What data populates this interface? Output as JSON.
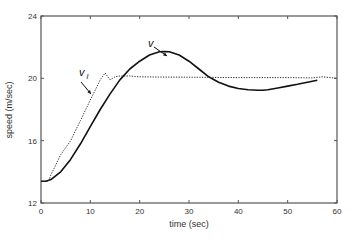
{
  "chart_data": {
    "type": "line",
    "title": "",
    "xlabel": "time (sec)",
    "ylabel": "speed (m/sec)",
    "xlim": [
      0,
      60
    ],
    "ylim": [
      12,
      24
    ],
    "xticks": [
      0,
      10,
      20,
      30,
      40,
      50,
      60
    ],
    "yticks": [
      12,
      16,
      20,
      24
    ],
    "grid": false,
    "legend": null,
    "series": [
      {
        "name": "v",
        "style": "solid",
        "x": [
          0,
          1,
          2,
          4,
          6,
          8,
          10,
          12,
          14,
          16,
          18,
          20,
          22,
          24,
          25,
          26,
          28,
          30,
          32,
          34,
          36,
          38,
          40,
          42,
          44,
          45,
          46,
          48,
          50,
          52,
          54,
          56
        ],
        "y": [
          13.4,
          13.4,
          13.5,
          14.0,
          14.8,
          15.8,
          16.9,
          18.0,
          19.0,
          19.9,
          20.6,
          21.1,
          21.5,
          21.7,
          21.72,
          21.7,
          21.5,
          21.1,
          20.6,
          20.1,
          19.75,
          19.5,
          19.35,
          19.27,
          19.24,
          19.24,
          19.27,
          19.38,
          19.5,
          19.62,
          19.75,
          19.88
        ]
      },
      {
        "name": "v_l",
        "style": "dotted",
        "x": [
          0,
          1.5,
          2,
          4,
          6,
          8,
          10,
          12,
          13,
          14,
          15,
          16,
          18,
          20,
          25,
          30,
          35,
          40,
          45,
          50,
          55,
          57,
          60
        ],
        "y": [
          13.4,
          13.4,
          13.8,
          15.1,
          16.0,
          17.3,
          18.6,
          19.9,
          20.35,
          19.9,
          20.1,
          20.15,
          20.15,
          20.1,
          20.08,
          20.07,
          20.06,
          20.05,
          20.05,
          20.05,
          20.03,
          20.1,
          20.0
        ]
      }
    ],
    "annotations": [
      {
        "text": "v",
        "arrow_to": [
          20.5,
          20.85
        ]
      },
      {
        "text": "v_l",
        "arrow_to": [
          10.5,
          18.8
        ]
      }
    ]
  },
  "labels": {
    "xlabel": "time (sec)",
    "ylabel": "speed (m/sec)",
    "ann_v": "v",
    "ann_vl_main": "v",
    "ann_vl_sub": "l"
  },
  "xticklabels": [
    "0",
    "10",
    "20",
    "30",
    "40",
    "50",
    "60"
  ],
  "yticklabels": [
    "12",
    "16",
    "20",
    "24"
  ]
}
